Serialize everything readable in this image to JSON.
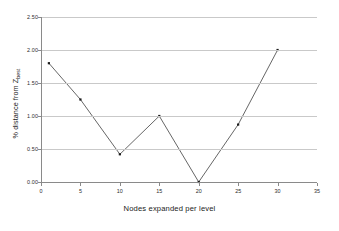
{
  "chart_data": {
    "type": "line",
    "title": "",
    "xlabel": "Nodes expanded per level",
    "ylabel": "% distance from Z_best",
    "ylabel_main": "% distance from Z",
    "ylabel_sub": "best",
    "x": [
      1,
      5,
      10,
      15,
      20,
      25,
      30
    ],
    "values": [
      1.8,
      1.25,
      0.42,
      1.0,
      0.0,
      0.87,
      2.0
    ],
    "series": [
      {
        "name": "% distance from Z_best",
        "values": [
          1.8,
          1.25,
          0.42,
          1.0,
          0.0,
          0.87,
          2.0
        ]
      }
    ],
    "xlim": [
      0,
      35
    ],
    "ylim": [
      0.0,
      2.5
    ],
    "xticks": [
      0,
      5,
      10,
      15,
      20,
      25,
      30,
      35
    ],
    "xtick_labels": [
      "0",
      "5",
      "10",
      "15",
      "20",
      "25",
      "30",
      "35"
    ],
    "yticks": [
      0.0,
      0.5,
      1.0,
      1.5,
      2.0,
      2.5
    ],
    "ytick_labels": [
      "0.00",
      "0.50",
      "1.00",
      "1.50",
      "2.00",
      "2.50"
    ],
    "grid": true,
    "grid_axis": "y",
    "legend": false,
    "legend_position": "none",
    "marker": "square",
    "line_color": "#555555",
    "marker_color": "#1a1a1a",
    "grid_color": "#c9c9c9",
    "axis_color": "#8a8a8a",
    "background": "#ffffff"
  }
}
